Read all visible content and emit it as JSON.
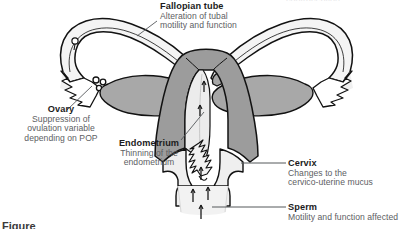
{
  "figure": {
    "background_color": "#ffffff",
    "title_label_color": "#1c1c1c",
    "description_color": "#5d6063",
    "leader_line_color": "#55585b",
    "outline_color": "#121212",
    "myometrium_fill": "#9c9c9c",
    "ovary_fill": "#a8a8a8",
    "cavity_fill": "#ececec",
    "tube_fill": "#f2f2f2"
  },
  "callouts": [
    {
      "id": "fallopian",
      "title": "Fallopian tube",
      "desc_lines": [
        "Alteration of tubal",
        "motility and function"
      ],
      "align": "left"
    },
    {
      "id": "ovary",
      "title": "Ovary",
      "desc_lines": [
        "Suppression of",
        "ovulation variable",
        "depending on POP"
      ],
      "align": "center"
    },
    {
      "id": "endometrium",
      "title": "Endometrium",
      "desc_lines": [
        "Thinning of the",
        "endometrium"
      ],
      "align": "center"
    },
    {
      "id": "cervix",
      "title": "Cervix",
      "desc_lines": [
        "Changes to the",
        "cervico-uterine mucus"
      ],
      "align": "left"
    },
    {
      "id": "sperm",
      "title": "Sperm",
      "desc_lines": [
        "Motility and function affected"
      ],
      "align": "left"
    }
  ],
  "caption": {
    "fragment": "Figure"
  },
  "heading_remnant": {
    "text": "contraception"
  }
}
